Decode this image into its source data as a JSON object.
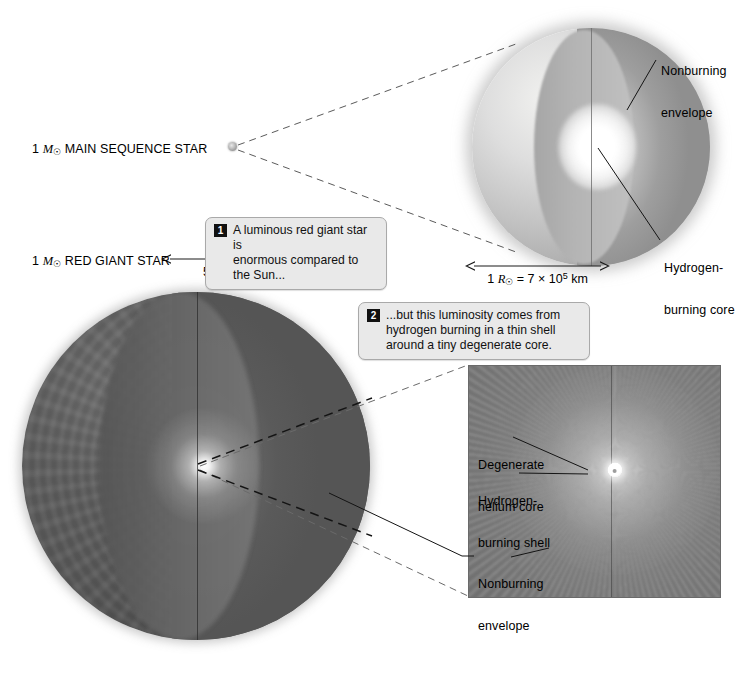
{
  "figure": {
    "background_color": "#ffffff"
  },
  "labels": {
    "main_sequence_star": {
      "prefix": "1 ",
      "symbol": "M",
      "symbol_sub": "☉",
      "text": " MAIN SEQUENCE STAR"
    },
    "red_giant_star": {
      "prefix": "1 ",
      "symbol": "M",
      "symbol_sub": "☉",
      "text": " RED GIANT STAR"
    }
  },
  "scale_bars": [
    {
      "id": "red-giant-scale",
      "prefix": "50 ",
      "symbol": "R",
      "symbol_sub": "☉",
      "equals": " = 3.5 × 10",
      "exponent": "7",
      "unit": " km"
    },
    {
      "id": "main-sequence-scale",
      "prefix": "1 ",
      "symbol": "R",
      "symbol_sub": "☉",
      "equals": " = 7 × 10",
      "exponent": "5",
      "unit": " km"
    }
  ],
  "callouts": [
    {
      "number": "1",
      "line1": "A luminous red giant star is",
      "line2": "enormous compared to the Sun..."
    },
    {
      "number": "2",
      "line1": "...but this luminosity comes from",
      "line2": "hydrogen burning in a thin shell",
      "line3": "around a tiny degenerate core."
    }
  ],
  "annotations": {
    "ms_nonburning_envelope": {
      "line1": "Nonburning",
      "line2": "envelope"
    },
    "ms_hydrogen_burning_core": {
      "line1": "Hydrogen-",
      "line2": "burning core"
    },
    "inset_degenerate_core": {
      "line1": "Degenerate",
      "line2": "helium core"
    },
    "inset_hydrogen_shell": {
      "line1": "Hydrogen-",
      "line2": "burning shell"
    },
    "inset_nonburning_envelope": {
      "line1": "Nonburning",
      "line2": "envelope"
    }
  },
  "colors": {
    "main_sequence_surface": "#d5d5d5",
    "main_sequence_core": "#ffffff",
    "red_giant_surface": "#5a5a5a",
    "inset_panel": "#878787",
    "callout_background": "#e9e9e9",
    "callout_border": "#a9a9a9",
    "leader_line": "#1a1a1a"
  }
}
